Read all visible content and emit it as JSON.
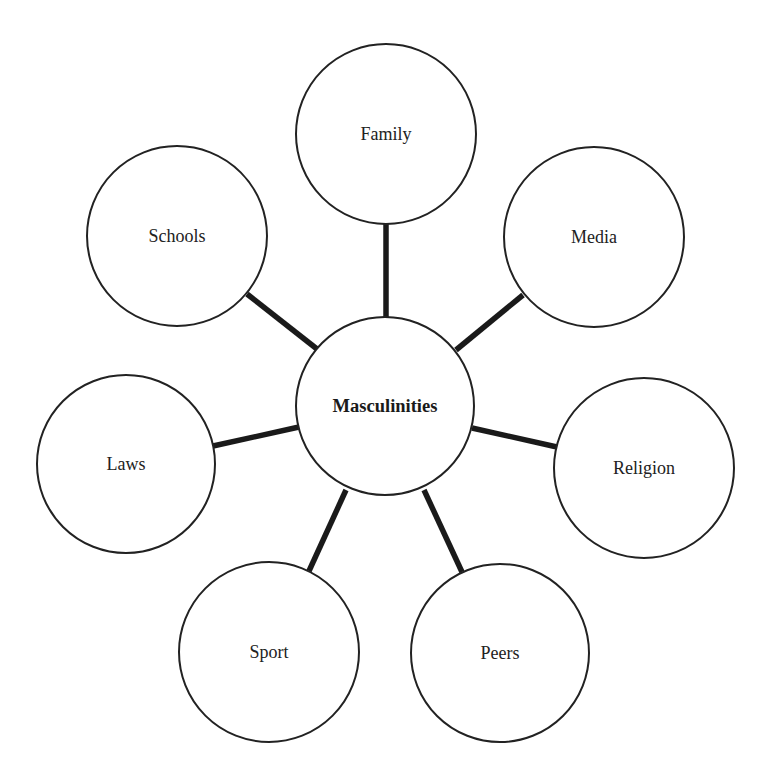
{
  "diagram": {
    "type": "hub-and-spoke",
    "center": {
      "label": "Masculinities",
      "cx": 385,
      "cy": 406,
      "r": 89
    },
    "nodes": [
      {
        "id": "family",
        "label": "Family",
        "cx": 386,
        "cy": 134,
        "r": 90
      },
      {
        "id": "media",
        "label": "Media",
        "cx": 594,
        "cy": 237,
        "r": 90
      },
      {
        "id": "religion",
        "label": "Religion",
        "cx": 644,
        "cy": 468,
        "r": 90
      },
      {
        "id": "peers",
        "label": "Peers",
        "cx": 500,
        "cy": 653,
        "r": 89
      },
      {
        "id": "sport",
        "label": "Sport",
        "cx": 269,
        "cy": 652,
        "r": 90
      },
      {
        "id": "laws",
        "label": "Laws",
        "cx": 126,
        "cy": 464,
        "r": 89
      },
      {
        "id": "schools",
        "label": "Schools",
        "cx": 177,
        "cy": 236,
        "r": 90
      }
    ],
    "connectors": [
      {
        "to": "family",
        "x1": 386,
        "y1": 317,
        "x2": 386,
        "y2": 224
      },
      {
        "to": "media",
        "x1": 456,
        "y1": 350,
        "x2": 523,
        "y2": 295
      },
      {
        "to": "religion",
        "x1": 472,
        "y1": 428,
        "x2": 557,
        "y2": 447
      },
      {
        "to": "peers",
        "x1": 424,
        "y1": 490,
        "x2": 462,
        "y2": 572
      },
      {
        "to": "sport",
        "x1": 346,
        "y1": 490,
        "x2": 309,
        "y2": 571
      },
      {
        "to": "laws",
        "x1": 299,
        "y1": 427,
        "x2": 213,
        "y2": 446
      },
      {
        "to": "schools",
        "x1": 317,
        "y1": 349,
        "x2": 247,
        "y2": 294
      }
    ]
  }
}
